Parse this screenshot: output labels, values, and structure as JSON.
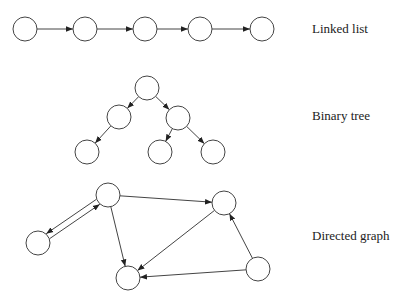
{
  "labels": {
    "linked_list": "Linked list",
    "binary_tree": "Binary tree",
    "directed_graph": "Directed graph"
  },
  "diagrams": {
    "linked_list": {
      "nodes": [
        [
          25,
          29
        ],
        [
          85,
          29
        ],
        [
          145,
          29
        ],
        [
          200,
          29
        ],
        [
          262,
          29
        ]
      ],
      "edges": [
        [
          0,
          1
        ],
        [
          1,
          2
        ],
        [
          2,
          3
        ],
        [
          3,
          4
        ]
      ]
    },
    "binary_tree": {
      "nodes": [
        [
          147,
          88
        ],
        [
          119,
          117
        ],
        [
          178,
          118
        ],
        [
          87,
          152
        ],
        [
          160,
          152
        ],
        [
          213,
          152
        ]
      ],
      "edges": [
        [
          0,
          1
        ],
        [
          0,
          2
        ],
        [
          1,
          3
        ],
        [
          2,
          4
        ],
        [
          2,
          5
        ]
      ]
    },
    "directed_graph": {
      "nodes": [
        [
          108,
          195
        ],
        [
          224,
          203
        ],
        [
          38,
          243
        ],
        [
          128,
          278
        ],
        [
          258,
          269
        ]
      ],
      "edges": [
        [
          0,
          1
        ],
        [
          0,
          2
        ],
        [
          2,
          0
        ],
        [
          0,
          3
        ],
        [
          1,
          3
        ],
        [
          4,
          3
        ],
        [
          4,
          1
        ]
      ]
    }
  },
  "style": {
    "node_radius": 12,
    "stroke": "#444444"
  }
}
